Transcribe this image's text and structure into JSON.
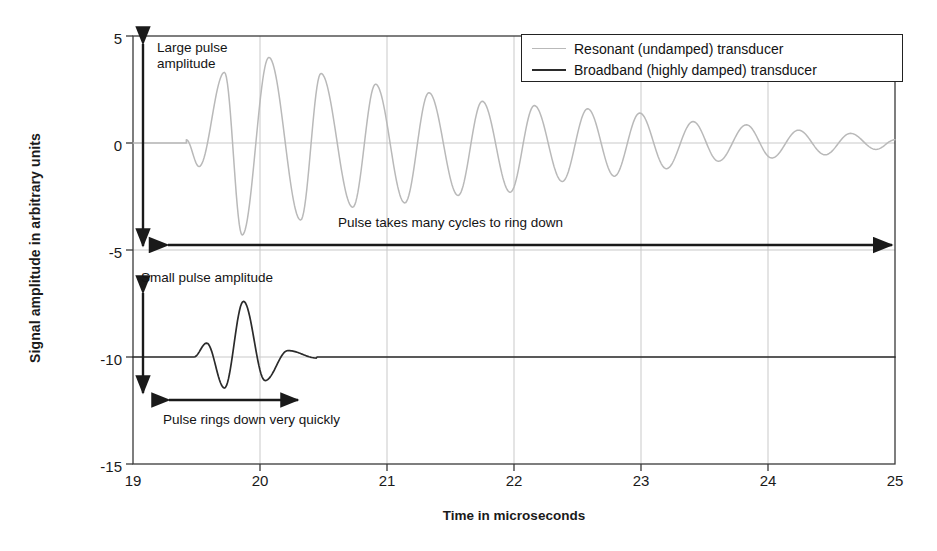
{
  "chart_data": {
    "type": "line",
    "title": "",
    "xlabel": "Time in microseconds",
    "ylabel": "Signal amplitude in arbitrary units",
    "xlim": [
      19,
      25
    ],
    "ylim": [
      -15,
      5
    ],
    "xticks": [
      "19",
      "20",
      "21",
      "22",
      "23",
      "24",
      "25"
    ],
    "yticks": [
      "5",
      "0",
      "-5",
      "-10",
      "-15"
    ],
    "grid": "vertical gridlines at each integer microsecond; horizontal gridlines at each y tick",
    "legend_position": "top-right inside plot",
    "series": [
      {
        "name": "Resonant (undamped) transducer",
        "color": "#b9b9b9",
        "baseline": 0,
        "description": "Long ringing sinusoidal burst, ~1.85 cycles per microsecond, slowly exponentially decaying",
        "peaks": [
          {
            "t": 19.42,
            "y": 0.15
          },
          {
            "t": 19.52,
            "y": -1.1
          },
          {
            "t": 19.72,
            "y": 3.3
          },
          {
            "t": 19.86,
            "y": -4.3
          },
          {
            "t": 20.07,
            "y": 4.0
          },
          {
            "t": 20.32,
            "y": -3.6
          },
          {
            "t": 20.48,
            "y": 3.25
          },
          {
            "t": 20.73,
            "y": -3.0
          },
          {
            "t": 20.91,
            "y": 2.75
          },
          {
            "t": 21.14,
            "y": -2.8
          },
          {
            "t": 21.33,
            "y": 2.35
          },
          {
            "t": 21.56,
            "y": -2.45
          },
          {
            "t": 21.75,
            "y": 1.95
          },
          {
            "t": 21.97,
            "y": -2.3
          },
          {
            "t": 22.16,
            "y": 1.75
          },
          {
            "t": 22.38,
            "y": -1.8
          },
          {
            "t": 22.58,
            "y": 1.6
          },
          {
            "t": 22.79,
            "y": -1.55
          },
          {
            "t": 22.99,
            "y": 1.4
          },
          {
            "t": 23.2,
            "y": -1.2
          },
          {
            "t": 23.41,
            "y": 1.0
          },
          {
            "t": 23.61,
            "y": -0.85
          },
          {
            "t": 23.83,
            "y": 0.85
          },
          {
            "t": 24.03,
            "y": -0.7
          },
          {
            "t": 24.24,
            "y": 0.6
          },
          {
            "t": 24.45,
            "y": -0.55
          },
          {
            "t": 24.65,
            "y": 0.45
          },
          {
            "t": 24.85,
            "y": -0.3
          },
          {
            "t": 25.0,
            "y": 0.15
          }
        ]
      },
      {
        "name": "Broadband (highly damped) transducer",
        "color": "#2b2b2b",
        "baseline": -10,
        "description": "Short damped pulse lasting about one microsecond, flat baseline thereafter",
        "peaks": [
          {
            "t": 19.48,
            "y": -10.0
          },
          {
            "t": 19.58,
            "y": -9.35
          },
          {
            "t": 19.72,
            "y": -11.45
          },
          {
            "t": 19.87,
            "y": -7.4
          },
          {
            "t": 20.04,
            "y": -11.1
          },
          {
            "t": 20.22,
            "y": -9.7
          },
          {
            "t": 20.45,
            "y": -10.05
          },
          {
            "t": 25.0,
            "y": -10.0
          }
        ]
      }
    ],
    "annotations": [
      {
        "id": "large-pulse-amplitude",
        "text": "Large pulse\namplitude",
        "arrow": "vertical double-headed arrow from y=+4.6 to y=-4.7 at t≈19.2"
      },
      {
        "id": "pulse-takes-many-cycles",
        "text": "Pulse takes many cycles to ring down",
        "arrow": "horizontal double-headed arrow from t≈19.35 to t≈24.95 at y≈-4.7"
      },
      {
        "id": "small-pulse-amplitude",
        "text": "Small pulse amplitude",
        "arrow": "vertical double-headed arrow from y=-6.7 to y=-13.35 at t≈19.2"
      },
      {
        "id": "pulse-rings-down-quickly",
        "text": "Pulse rings down very quickly",
        "arrow": "horizontal double-headed arrow from t≈19.33 to t≈21.35 at y≈-11.95"
      }
    ]
  },
  "legend": {
    "items": [
      {
        "label": "Resonant (undamped) transducer"
      },
      {
        "label": "Broadband (highly damped) transducer"
      }
    ]
  },
  "axes": {
    "y_title": "Signal amplitude in arbitrary units",
    "x_title": "Time in microseconds",
    "y_ticks": [
      "5",
      "0",
      "-5",
      "-10",
      "-15"
    ],
    "x_ticks": [
      "19",
      "20",
      "21",
      "22",
      "23",
      "24",
      "25"
    ]
  },
  "annotations": {
    "large_pulse_line1": "Large pulse",
    "large_pulse_line2": "amplitude",
    "many_cycles": "Pulse takes many cycles to ring down",
    "small_pulse": "Small pulse amplitude",
    "rings_down": "Pulse rings down very quickly"
  },
  "colors": {
    "resonant": "#b9b9b9",
    "broadband": "#2b2b2b",
    "axis": "#333333",
    "grid": "#c8c8c8",
    "background": "#ffffff"
  }
}
